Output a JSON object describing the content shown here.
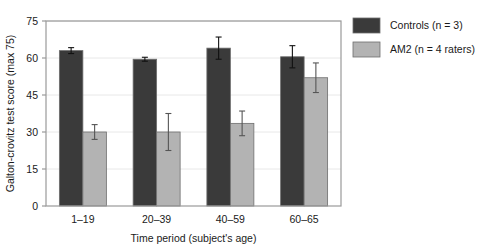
{
  "chart_data": {
    "type": "bar",
    "title": "",
    "xlabel": "Time period (subject's age)",
    "ylabel": "Galton-crovitz test score (max 75)",
    "categories": [
      "1–19",
      "20–39",
      "40–59",
      "60–65"
    ],
    "ylim": [
      0,
      75
    ],
    "yticks": [
      0,
      15,
      30,
      45,
      60,
      75
    ],
    "ytick_labels": [
      "0",
      "15",
      "30",
      "45",
      "60",
      "75"
    ],
    "grid": true,
    "legend_position": "right",
    "series": [
      {
        "name": "Controls (n = 3)",
        "color": "#3a3a3a",
        "values": [
          63.0,
          59.5,
          64.0,
          60.5
        ],
        "errors": [
          1.2,
          0.8,
          4.5,
          4.5
        ]
      },
      {
        "name": "AM2 (n = 4 raters)",
        "color": "#b3b3b3",
        "values": [
          30.0,
          30.0,
          33.5,
          52.0
        ],
        "errors": [
          3.0,
          7.5,
          5.0,
          6.0
        ]
      }
    ]
  },
  "legend": {
    "items": [
      {
        "label": "Controls (n = 3)",
        "color": "#3a3a3a"
      },
      {
        "label": "AM2 (n = 4 raters)",
        "color": "#b3b3b3"
      }
    ]
  },
  "axes": {
    "y_title": "Galton-crovitz test score (max 75)",
    "x_title": "Time period (subject's age)"
  },
  "colors": {
    "controls": "#3a3a3a",
    "am2": "#b3b3b3",
    "frame": "#9a9a9a",
    "grid": "#e8e8e8",
    "text": "#1a1a1a",
    "background": "#ffffff"
  }
}
